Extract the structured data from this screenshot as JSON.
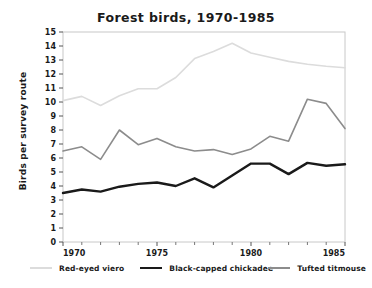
{
  "chart_data": {
    "type": "line",
    "title": "Forest birds, 1970-1985",
    "xlabel": "",
    "ylabel": "Birds per survey route",
    "x": [
      1970,
      1971,
      1972,
      1973,
      1974,
      1975,
      1976,
      1977,
      1978,
      1979,
      1980,
      1981,
      1982,
      1983,
      1984,
      1985
    ],
    "xlim": [
      1970,
      1985
    ],
    "ylim": [
      0,
      15
    ],
    "ytick_labels": [
      "0",
      "1",
      "2",
      "3",
      "4",
      "5",
      "6",
      "7",
      "8",
      "9",
      "10",
      "11",
      "12",
      "13",
      "14",
      "15"
    ],
    "yticks": [
      0,
      1,
      2,
      3,
      4,
      5,
      6,
      7,
      8,
      9,
      10,
      11,
      12,
      13,
      14,
      15
    ],
    "xtick_labels": [
      "1970",
      "1975",
      "1980",
      "1985"
    ],
    "xticks": [
      1970,
      1975,
      1980,
      1985
    ],
    "xtick_minor": [
      1971,
      1972,
      1973,
      1974,
      1976,
      1977,
      1978,
      1979,
      1981,
      1982,
      1983,
      1984
    ],
    "grid": false,
    "legend_position": "bottom",
    "series": [
      {
        "name": "Red-eyed viero",
        "color": "#dcdcdc",
        "width": 1.6,
        "values": [
          10.1,
          10.4,
          9.75,
          10.45,
          10.95,
          10.95,
          11.75,
          13.1,
          13.6,
          14.2,
          13.5,
          13.2,
          12.9,
          12.7,
          12.55,
          12.45
        ]
      },
      {
        "name": "Black-capped chickadee",
        "color": "#1a1a1a",
        "width": 2.4,
        "values": [
          3.5,
          3.75,
          3.6,
          3.95,
          4.15,
          4.25,
          4.0,
          4.55,
          3.9,
          4.75,
          5.6,
          5.6,
          4.85,
          5.65,
          5.45,
          5.55
        ]
      },
      {
        "name": "Tufted titmouse",
        "color": "#8c8c8c",
        "width": 1.6,
        "values": [
          6.5,
          6.8,
          5.9,
          8.0,
          6.95,
          7.4,
          6.8,
          6.5,
          6.6,
          6.25,
          6.65,
          7.55,
          7.2,
          10.2,
          9.9,
          8.1
        ]
      }
    ]
  }
}
